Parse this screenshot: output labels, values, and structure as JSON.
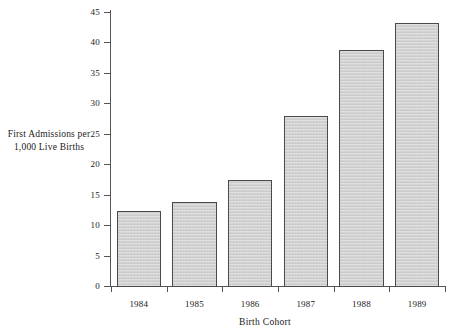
{
  "chart_data": {
    "type": "bar",
    "title": "",
    "categories": [
      "1984",
      "1985",
      "1986",
      "1987",
      "1988",
      "1989"
    ],
    "values": [
      12.5,
      14.0,
      17.5,
      28.1,
      38.9,
      43.3
    ],
    "xlabel": "Birth Cohort",
    "ylabel": "First Admissions per 1,000 Live Births",
    "ylabel_lines": [
      "First Admissions per",
      "1,000 Live Births"
    ],
    "ylim": [
      0,
      45
    ],
    "yticks": [
      0,
      5,
      10,
      15,
      20,
      25,
      30,
      35,
      40,
      45
    ],
    "ytick_labels": [
      "0",
      "5",
      "10",
      "15",
      "20",
      "25",
      "30",
      "35",
      "40",
      "45"
    ],
    "grid": false,
    "legend": null,
    "colors": {
      "bar_fill": "#d2d2d2",
      "bar_border": "#4a4a4a",
      "axis": "#555555",
      "text": "#1a1a1a",
      "background": "#ffffff"
    }
  }
}
